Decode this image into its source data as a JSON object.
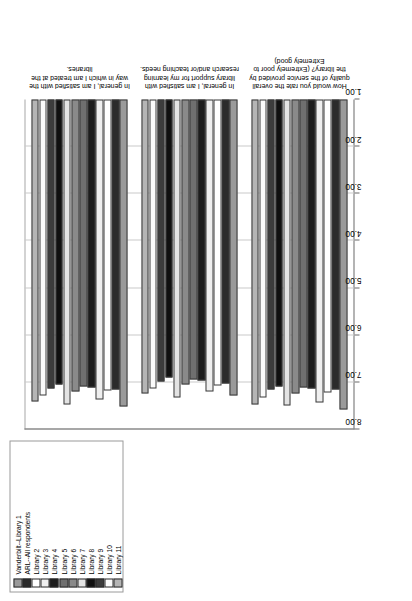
{
  "chart_data": {
    "type": "bar",
    "orientation": "horizontal",
    "title": "",
    "subtitle": "",
    "xlabel": "",
    "ylabel": "",
    "xlim": [
      1.0,
      8.0
    ],
    "xticks": [
      "1.00",
      "2.00",
      "3.00",
      "4.00",
      "5.00",
      "6.00",
      "7.00",
      "8.00"
    ],
    "xtick_values": [
      1.0,
      2.0,
      3.0,
      4.0,
      5.0,
      6.0,
      7.0,
      8.0
    ],
    "grid": true,
    "legend_position": "top-left",
    "categories": [
      "In general, I am satisfied with the way in which I am treated at the libraries.",
      "In general, I am satisfied with library support for my learning research and/or teaching needs.",
      "How would you rate the overall quality of the service provided by the library? (Extremely poor to Extremely good)"
    ],
    "series": [
      {
        "name": "Vanderbilt--Library 1",
        "color": "#9a9a9a",
        "values": [
          7.52,
          7.28,
          7.58
        ]
      },
      {
        "name": "ARL--All respondents",
        "color": "#2b2b2b",
        "values": [
          7.15,
          7.02,
          7.15
        ]
      },
      {
        "name": "Library 2",
        "color": "#ffffff",
        "values": [
          7.18,
          7.06,
          7.22
        ]
      },
      {
        "name": "Library 3",
        "color": "#efefef",
        "values": [
          7.36,
          7.2,
          7.42
        ]
      },
      {
        "name": "Library 4",
        "color": "#1c1c1c",
        "values": [
          7.1,
          6.96,
          7.12
        ]
      },
      {
        "name": "Library 5",
        "color": "#6f6f6f",
        "values": [
          7.08,
          6.94,
          7.1
        ]
      },
      {
        "name": "Library 6",
        "color": "#8a8a8a",
        "values": [
          7.2,
          7.05,
          7.24
        ]
      },
      {
        "name": "Library 7",
        "color": "#e3e3e3",
        "values": [
          7.46,
          7.32,
          7.5
        ]
      },
      {
        "name": "Library 8",
        "color": "#101010",
        "values": [
          7.05,
          6.9,
          7.08
        ]
      },
      {
        "name": "Library 9",
        "color": "#3c3c3c",
        "values": [
          7.12,
          6.98,
          7.16
        ]
      },
      {
        "name": "Library 10",
        "color": "#fbfbfb",
        "values": [
          7.28,
          7.12,
          7.32
        ]
      },
      {
        "name": "Library 11",
        "color": "#b5b5b5",
        "values": [
          7.4,
          7.24,
          7.46
        ]
      }
    ]
  },
  "legend": {
    "items": [
      {
        "label": "Vanderbilt--Library 1"
      },
      {
        "label": "ARL--All respondents"
      },
      {
        "label": "Library 2"
      },
      {
        "label": "Library 3"
      },
      {
        "label": "Library 4"
      },
      {
        "label": "Library 5"
      },
      {
        "label": "Library 6"
      },
      {
        "label": "Library 7"
      },
      {
        "label": "Library 8"
      },
      {
        "label": "Library 9"
      },
      {
        "label": "Library 10"
      },
      {
        "label": "Library 11"
      }
    ]
  }
}
